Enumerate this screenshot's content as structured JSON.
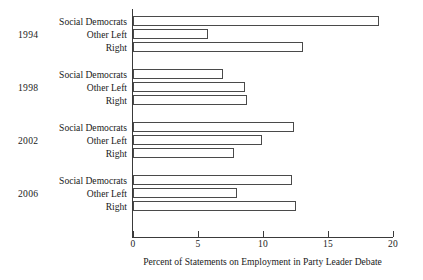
{
  "chart_data": {
    "type": "bar",
    "orientation": "horizontal",
    "title": "",
    "xlabel": "Percent of Statements on Employment in Party Leader Debate",
    "ylabel": "",
    "xlim": [
      0,
      20
    ],
    "xticks": [
      0,
      5,
      10,
      15,
      20
    ],
    "xtick_labels": [
      "0",
      "5",
      "10",
      "15",
      "20"
    ],
    "grid": false,
    "legend": "none",
    "group_field": "year",
    "categories": [
      "Social Democrats",
      "Other Left",
      "Right"
    ],
    "groups": [
      {
        "year": "1994",
        "bars": [
          {
            "category": "Social Democrats",
            "value": 18.9
          },
          {
            "category": "Other Left",
            "value": 5.8
          },
          {
            "category": "Right",
            "value": 13.1
          }
        ]
      },
      {
        "year": "1998",
        "bars": [
          {
            "category": "Social Democrats",
            "value": 6.9
          },
          {
            "category": "Other Left",
            "value": 8.6
          },
          {
            "category": "Right",
            "value": 8.8
          }
        ]
      },
      {
        "year": "2002",
        "bars": [
          {
            "category": "Social Democrats",
            "value": 12.4
          },
          {
            "category": "Other Left",
            "value": 9.9
          },
          {
            "category": "Right",
            "value": 7.8
          }
        ]
      },
      {
        "year": "2006",
        "bars": [
          {
            "category": "Social Democrats",
            "value": 12.2
          },
          {
            "category": "Other Left",
            "value": 8.0
          },
          {
            "category": "Right",
            "value": 12.5
          }
        ]
      }
    ],
    "colors": {
      "bar_fill": "#ffffff",
      "bar_stroke": "#4a4a4a",
      "axis": "#3a3a3a",
      "text": "#1a1a1a",
      "background": "#ffffff"
    }
  }
}
